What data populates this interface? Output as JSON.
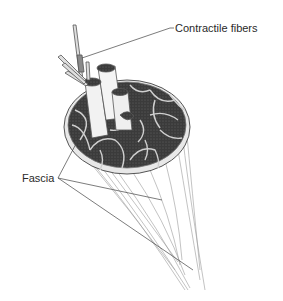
{
  "diagram": {
    "labels": {
      "contractile_fibers": "Contractile fibers",
      "fascia": "Fascia"
    },
    "colors": {
      "background": "#ffffff",
      "fascicle_fill": "#3a3a3a",
      "outline": "#555555",
      "leader_line": "#444444",
      "label_text": "#2a2a2a"
    }
  }
}
